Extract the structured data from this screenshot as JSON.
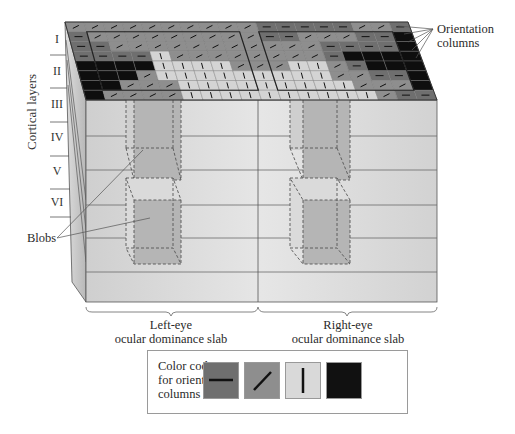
{
  "figure": {
    "labels": {
      "orientation_columns": [
        "Orientation",
        "columns"
      ],
      "cortical_layers": "Cortical layers",
      "blobs": "Blobs",
      "left_slab": [
        "Left-eye",
        "ocular dominance slab"
      ],
      "right_slab": [
        "Right-eye",
        "ocular dominance slab"
      ]
    },
    "layers": [
      "I",
      "II",
      "III",
      "IV",
      "V",
      "VI"
    ],
    "legend": {
      "title_lines": [
        "Color code",
        "for orientation",
        "columns"
      ],
      "swatches": [
        {
          "name": "horizontal",
          "color": "#6f6f6f",
          "glyph": "horizontal-bar"
        },
        {
          "name": "oblique",
          "color": "#8e8e8e",
          "glyph": "diagonal-bar"
        },
        {
          "name": "vertical",
          "color": "#d9d9d9",
          "glyph": "vertical-bar"
        },
        {
          "name": "other",
          "color": "#111111",
          "glyph": "none"
        }
      ]
    },
    "colors": {
      "front_face": "#d6d6d6",
      "side_face": "#bdbdbd",
      "blob_fill": "#b3b3b3",
      "edge": "#555555"
    }
  }
}
